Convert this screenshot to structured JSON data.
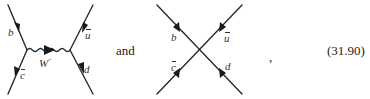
{
  "equation": {
    "number": "(31.90)",
    "connector": "and",
    "trailing_punctuation": ","
  },
  "diagram_exchange": {
    "type": "W-exchange tree diagram",
    "particles": {
      "top_left": "b",
      "bottom_left": "c",
      "top_right": "u",
      "bottom_right": "d",
      "propagator": "W",
      "propagator_charge": "−"
    },
    "bars": {
      "bottom_left": true,
      "top_right": true
    }
  },
  "diagram_contact": {
    "type": "four-fermion contact interaction",
    "particles": {
      "top_left": "b",
      "bottom_left": "c",
      "top_right": "u",
      "bottom_right": "d"
    },
    "bars": {
      "bottom_left": true,
      "top_right": true
    }
  },
  "colors": {
    "line": "#2a2a2a",
    "text": "#222222",
    "background": "#ffffff"
  }
}
